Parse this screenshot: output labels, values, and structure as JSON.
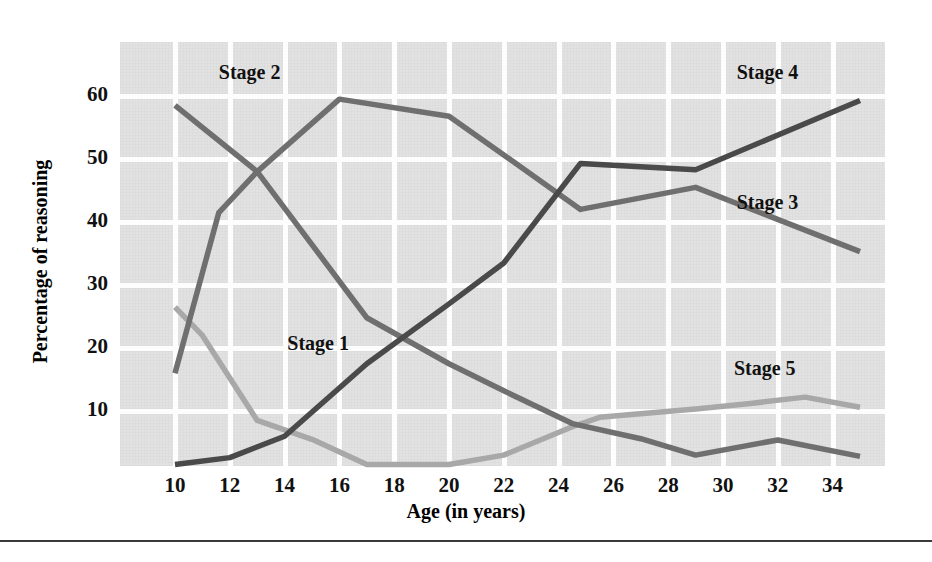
{
  "figure": {
    "background_color": "#ffffff",
    "plot_background_color": "#e2e2e2",
    "gridline_color": "#fdfdfd"
  },
  "chart_data": {
    "type": "line",
    "title": "",
    "xlabel": "Age (in years)",
    "ylabel": "Percentage of reasoning",
    "xlim": [
      9.5,
      35
    ],
    "ylim": [
      0,
      63
    ],
    "xticks": [
      10,
      12,
      14,
      16,
      18,
      20,
      22,
      24,
      26,
      28,
      30,
      32,
      34
    ],
    "yticks": [
      10,
      20,
      30,
      40,
      50,
      60
    ],
    "grid": true,
    "legend": "inline-labels",
    "series": [
      {
        "name": "Stage 1",
        "color": "#a8a8a8",
        "label_x": 14.1,
        "label_y": 20.5,
        "points": [
          [
            10,
            26.5
          ],
          [
            11,
            22.0
          ],
          [
            13,
            8.5
          ],
          [
            15,
            5.5
          ],
          [
            17,
            1.5
          ],
          [
            20,
            1.5
          ],
          [
            22,
            3.0
          ],
          [
            24.5,
            7.5
          ],
          [
            25.5,
            9.0
          ],
          [
            29,
            10.3
          ],
          [
            31,
            11.2
          ],
          [
            33,
            12.2
          ],
          [
            35,
            10.6
          ]
        ]
      },
      {
        "name": "Stage 2",
        "color": "#6f6f6f",
        "label_x": 11.6,
        "label_y": 63.5,
        "points": [
          [
            10,
            58.5
          ],
          [
            13,
            48.0
          ],
          [
            17,
            24.8
          ],
          [
            20,
            17.5
          ],
          [
            22,
            13.2
          ],
          [
            24.5,
            8.0
          ],
          [
            27,
            5.6
          ],
          [
            29,
            3.0
          ],
          [
            32,
            5.4
          ],
          [
            35,
            2.8
          ]
        ]
      },
      {
        "name": "Stage 3",
        "color": "#6f6f6f",
        "label_x": 30.5,
        "label_y": 42.8,
        "points": [
          [
            10,
            16.0
          ],
          [
            11.6,
            41.5
          ],
          [
            13,
            48.0
          ],
          [
            16,
            59.5
          ],
          [
            20,
            56.8
          ],
          [
            24.8,
            42.0
          ],
          [
            29,
            45.5
          ],
          [
            35,
            35.3
          ]
        ]
      },
      {
        "name": "Stage 4",
        "color": "#4a4a4a",
        "label_x": 30.5,
        "label_y": 63.5,
        "points": [
          [
            10,
            1.5
          ],
          [
            12,
            2.6
          ],
          [
            14,
            6.0
          ],
          [
            17,
            17.5
          ],
          [
            20,
            27.0
          ],
          [
            22,
            33.5
          ],
          [
            24.8,
            49.3
          ],
          [
            29,
            48.3
          ],
          [
            35,
            59.3
          ]
        ]
      },
      {
        "name": "Stage 5",
        "color": "#a8a8a8",
        "label_x": 30.4,
        "label_y": 16.5,
        "points": []
      }
    ],
    "annotations": [
      "Stage 1",
      "Stage 2",
      "Stage 3",
      "Stage 4",
      "Stage 5"
    ]
  }
}
